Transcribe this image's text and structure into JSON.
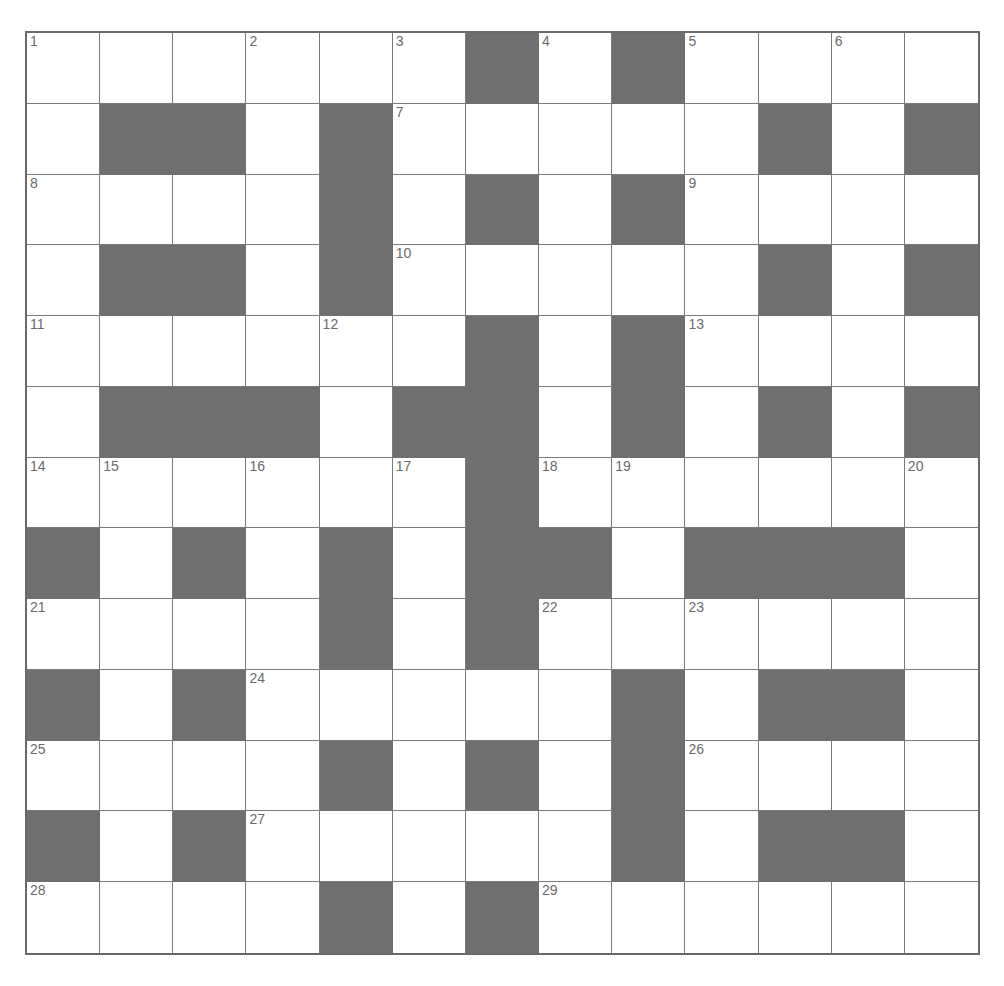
{
  "puzzle": {
    "rows": 13,
    "cols": 13,
    "colors": {
      "block": "#6f6f6f",
      "cell": "#ffffff",
      "line": "#7a7a7a",
      "number": "#6a6a6a"
    },
    "layout": [
      "......#.#....",
      ".##.#.....#.#",
      "....#.#.#....",
      ".##.#.....#.#",
      "......#.#....",
      ".###.##.#.#.#",
      "......#......",
      "#.#.#.##.###.",
      "....#.#......",
      "#.#.....#.##.",
      "....#.#.#....",
      "#.#.....#.##.",
      "....#.#......"
    ],
    "numbers": [
      {
        "r": 0,
        "c": 0,
        "n": "1"
      },
      {
        "r": 0,
        "c": 3,
        "n": "2"
      },
      {
        "r": 0,
        "c": 5,
        "n": "3"
      },
      {
        "r": 0,
        "c": 7,
        "n": "4"
      },
      {
        "r": 0,
        "c": 9,
        "n": "5"
      },
      {
        "r": 0,
        "c": 11,
        "n": "6"
      },
      {
        "r": 1,
        "c": 5,
        "n": "7"
      },
      {
        "r": 2,
        "c": 0,
        "n": "8"
      },
      {
        "r": 2,
        "c": 9,
        "n": "9"
      },
      {
        "r": 3,
        "c": 5,
        "n": "10"
      },
      {
        "r": 4,
        "c": 0,
        "n": "11"
      },
      {
        "r": 4,
        "c": 4,
        "n": "12"
      },
      {
        "r": 4,
        "c": 9,
        "n": "13"
      },
      {
        "r": 6,
        "c": 0,
        "n": "14"
      },
      {
        "r": 6,
        "c": 1,
        "n": "15"
      },
      {
        "r": 6,
        "c": 3,
        "n": "16"
      },
      {
        "r": 6,
        "c": 5,
        "n": "17"
      },
      {
        "r": 6,
        "c": 7,
        "n": "18"
      },
      {
        "r": 6,
        "c": 8,
        "n": "19"
      },
      {
        "r": 6,
        "c": 12,
        "n": "20"
      },
      {
        "r": 8,
        "c": 0,
        "n": "21"
      },
      {
        "r": 8,
        "c": 7,
        "n": "22"
      },
      {
        "r": 8,
        "c": 9,
        "n": "23"
      },
      {
        "r": 9,
        "c": 3,
        "n": "24"
      },
      {
        "r": 10,
        "c": 0,
        "n": "25"
      },
      {
        "r": 10,
        "c": 9,
        "n": "26"
      },
      {
        "r": 11,
        "c": 3,
        "n": "27"
      },
      {
        "r": 12,
        "c": 0,
        "n": "28"
      },
      {
        "r": 12,
        "c": 7,
        "n": "29"
      }
    ]
  }
}
